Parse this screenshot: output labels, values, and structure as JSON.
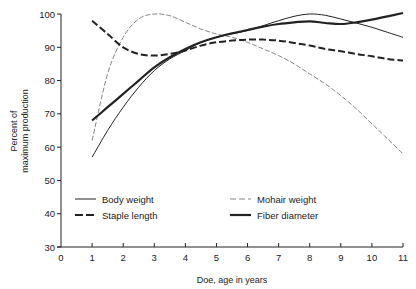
{
  "chart_data": {
    "type": "line",
    "title": "",
    "xlabel": "Doe, age in years",
    "ylabel": "Percent of maximum production",
    "ylabel_lines": [
      "Percent of",
      "maximum production"
    ],
    "xlim": [
      0,
      11
    ],
    "ylim": [
      30,
      100
    ],
    "xticks": [
      0,
      1,
      2,
      3,
      4,
      5,
      6,
      7,
      8,
      9,
      10,
      11
    ],
    "yticks": [
      30,
      40,
      50,
      60,
      70,
      80,
      90,
      100
    ],
    "grid": false,
    "legend_position": "lower-left inside plot, two columns",
    "x": [
      1,
      1.5,
      2,
      2.5,
      3,
      3.5,
      4,
      4.5,
      5,
      5.5,
      6,
      6.5,
      7,
      7.5,
      8,
      8.5,
      9,
      9.5,
      10,
      10.5,
      11
    ],
    "series": [
      {
        "name": "Body weight",
        "style": "thin-solid",
        "values": [
          57,
          65,
          72,
          78,
          83,
          86.5,
          89,
          91.5,
          93,
          94,
          95,
          96.5,
          98,
          99.3,
          100,
          99.6,
          98.5,
          97.3,
          96,
          94.5,
          93
        ]
      },
      {
        "name": "Mohair weight",
        "style": "thin-dashed",
        "values": [
          62,
          82,
          93,
          98.5,
          100,
          99.5,
          97.5,
          95.5,
          94,
          93,
          91.5,
          89.5,
          87.5,
          85,
          82,
          79,
          75.5,
          71.5,
          67,
          62.5,
          58
        ]
      },
      {
        "name": "Staple length",
        "style": "thick-dashed",
        "values": [
          98,
          94,
          90,
          88,
          87.5,
          88,
          89,
          90.5,
          91.5,
          92,
          92.3,
          92.3,
          92,
          91.3,
          90.5,
          89.5,
          88.8,
          88,
          87.3,
          86.5,
          86
        ]
      },
      {
        "name": "Fiber diameter",
        "style": "thick-solid",
        "values": [
          68,
          72,
          76,
          80,
          84,
          87,
          89.5,
          91.5,
          93,
          94.2,
          95.2,
          96.2,
          97,
          97.5,
          97.8,
          97.3,
          97,
          97.5,
          98.3,
          99.3,
          100.3
        ]
      }
    ]
  },
  "legend": {
    "items": [
      {
        "label": "Body weight",
        "style": "thin-solid"
      },
      {
        "label": "Mohair weight",
        "style": "thin-dashed"
      },
      {
        "label": "Staple length",
        "style": "thick-dashed"
      },
      {
        "label": "Fiber diameter",
        "style": "thick-solid"
      }
    ]
  },
  "colors": {
    "ink": "#222222",
    "mohair": "#777777",
    "background": "#ffffff"
  }
}
